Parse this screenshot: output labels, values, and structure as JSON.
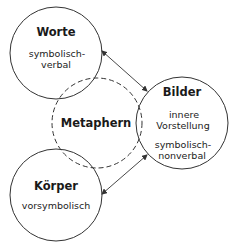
{
  "diagram": {
    "nodes": {
      "worte": {
        "title": "Worte",
        "lines": [
          "symbolisch-",
          "verbal"
        ]
      },
      "bilder": {
        "title": "Bilder",
        "lines": [
          "innere",
          "Vorstellung"
        ],
        "lines2": [
          "symbolisch-",
          "nonverbal"
        ]
      },
      "koerper": {
        "title": "Körper",
        "lines": [
          "vorsymbolisch"
        ]
      },
      "metaphern": {
        "title": "Metaphern"
      }
    },
    "edges": [
      {
        "from": "Worte",
        "to": "Bilder",
        "type": "bidirectional-arrow"
      },
      {
        "from": "Körper",
        "to": "Bilder",
        "type": "bidirectional-arrow"
      }
    ],
    "colors": {
      "stroke": "#333333",
      "text": "#1a1a1a",
      "background": "#ffffff"
    }
  }
}
